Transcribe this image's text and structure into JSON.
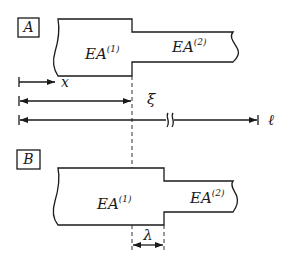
{
  "diagram": {
    "panel_a": {
      "label": "A",
      "section1": {
        "name": "EA",
        "sup": "(1)"
      },
      "section2": {
        "name": "EA",
        "sup": "(2)"
      }
    },
    "panel_b": {
      "label": "B",
      "section1": {
        "name": "EA",
        "sup": "(1)"
      },
      "section2": {
        "name": "EA",
        "sup": "(2)"
      }
    },
    "dimensions": {
      "x_label": "x",
      "xi_label": "ξ",
      "ell_label": "ℓ",
      "lambda_label": "λ"
    }
  },
  "colors": {
    "ink": "#1a1a1a",
    "background": "#ffffff"
  }
}
